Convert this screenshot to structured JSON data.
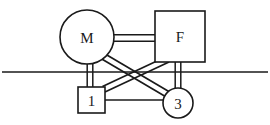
{
  "diagram": {
    "background_color": "#ffffff",
    "stroke_color": "#1a1a1a",
    "width": 270,
    "height": 125,
    "nodes": [
      {
        "id": "M",
        "label": "M",
        "shape": "circle",
        "cx": 87,
        "cy": 37,
        "r": 27,
        "description": "motor circle upper left"
      },
      {
        "id": "F",
        "label": "F",
        "shape": "rect",
        "x": 155,
        "y": 11,
        "w": 50,
        "h": 51,
        "description": "frame box upper right"
      },
      {
        "id": "1",
        "label": "1",
        "shape": "rect",
        "x": 78,
        "y": 87,
        "w": 27,
        "h": 26,
        "description": "element one box lower left"
      },
      {
        "id": "3",
        "label": "3",
        "shape": "circle",
        "cx": 178,
        "cy": 103,
        "r": 15,
        "description": "element three circle lower right"
      }
    ],
    "ground_line": {
      "name": "ground-reference-line",
      "x1": 2,
      "y1": 72,
      "x2": 268,
      "y2": 72
    },
    "double_links": [
      {
        "id": "M-F",
        "from": "M",
        "to": "F",
        "x1": 113,
        "y1": 38,
        "x2": 156,
        "y2": 38,
        "description": "horizontal double rail between M and F"
      },
      {
        "id": "M-1",
        "from": "M",
        "to": "1",
        "x1": 90,
        "y1": 63,
        "x2": 90,
        "y2": 88,
        "description": "vertical double rail between M and box 1"
      },
      {
        "id": "F-3",
        "from": "F",
        "to": "3",
        "x1": 178,
        "y1": 62,
        "x2": 178,
        "y2": 90,
        "description": "vertical double rail between F and circle 3"
      },
      {
        "id": "M-3",
        "from": "M",
        "to": "3",
        "x1": 105,
        "y1": 56,
        "x2": 170,
        "y2": 95,
        "description": "diagonal double rail from M down-right to circle 3"
      },
      {
        "id": "1-F",
        "from": "1",
        "to": "F",
        "x1": 104,
        "y1": 90,
        "x2": 165,
        "y2": 60,
        "description": "diagonal double rail from box 1 up-right to F"
      }
    ],
    "thin_links": [
      {
        "id": "1-3",
        "from": "1",
        "to": "3",
        "x1": 105,
        "y1": 100,
        "x2": 164,
        "y2": 100,
        "description": "thin horizontal line between box 1 and circle 3"
      }
    ]
  }
}
